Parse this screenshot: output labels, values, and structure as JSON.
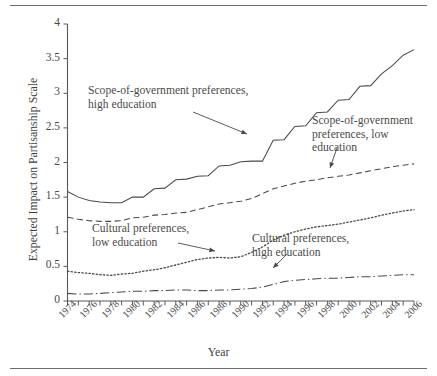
{
  "chart_data": {
    "type": "line",
    "title": "",
    "xlabel": "Year",
    "ylabel": "Expected Impact on Partisanship Scale",
    "xlim": [
      1974,
      2006
    ],
    "ylim": [
      0,
      4
    ],
    "yticks": [
      "0",
      "0.5",
      "1",
      "1.5",
      "2",
      "2.5",
      "3",
      "3.5",
      "4"
    ],
    "ytick_values": [
      0,
      0.5,
      1,
      1.5,
      2,
      2.5,
      3,
      3.5,
      4
    ],
    "xticks": [
      "1974",
      "1976",
      "1978",
      "1980",
      "1982",
      "1984",
      "1986",
      "1988",
      "1990",
      "1992",
      "1994",
      "1996",
      "1998",
      "2000",
      "2002",
      "2004",
      "2006"
    ],
    "xtick_values": [
      1974,
      1976,
      1978,
      1980,
      1982,
      1984,
      1986,
      1988,
      1990,
      1992,
      1994,
      1996,
      1998,
      2000,
      2002,
      2004,
      2006
    ],
    "minor_ticks_every": 1,
    "grid": false,
    "legend_position": "inline-annotations",
    "x": [
      1974,
      1975,
      1976,
      1977,
      1978,
      1979,
      1980,
      1981,
      1982,
      1983,
      1984,
      1985,
      1986,
      1987,
      1988,
      1989,
      1990,
      1991,
      1992,
      1993,
      1994,
      1995,
      1996,
      1997,
      1998,
      1999,
      2000,
      2001,
      2002,
      2003,
      2004,
      2005,
      2006
    ],
    "series": [
      {
        "name": "Scope-of-government preferences, high education",
        "style": "solid",
        "values": [
          1.58,
          1.5,
          1.45,
          1.43,
          1.42,
          1.42,
          1.5,
          1.5,
          1.62,
          1.63,
          1.75,
          1.76,
          1.8,
          1.81,
          1.95,
          1.96,
          2.01,
          2.02,
          2.02,
          2.32,
          2.33,
          2.52,
          2.53,
          2.72,
          2.73,
          2.9,
          2.91,
          3.1,
          3.11,
          3.28,
          3.4,
          3.55,
          3.63
        ]
      },
      {
        "name": "Scope-of-government preferences, low education",
        "style": "dashed",
        "values": [
          1.21,
          1.18,
          1.16,
          1.15,
          1.15,
          1.16,
          1.2,
          1.21,
          1.24,
          1.25,
          1.27,
          1.28,
          1.32,
          1.36,
          1.4,
          1.42,
          1.44,
          1.48,
          1.55,
          1.62,
          1.66,
          1.7,
          1.73,
          1.75,
          1.78,
          1.8,
          1.82,
          1.85,
          1.88,
          1.91,
          1.94,
          1.96,
          1.98
        ]
      },
      {
        "name": "Cultural preferences, low education",
        "style": "dotted",
        "values": [
          0.43,
          0.41,
          0.4,
          0.38,
          0.37,
          0.39,
          0.4,
          0.43,
          0.45,
          0.48,
          0.52,
          0.56,
          0.6,
          0.62,
          0.63,
          0.62,
          0.64,
          0.7,
          0.78,
          0.88,
          0.95,
          1.0,
          1.04,
          1.07,
          1.09,
          1.11,
          1.14,
          1.17,
          1.2,
          1.24,
          1.27,
          1.3,
          1.32
        ]
      },
      {
        "name": "Cultural preferences, high education",
        "style": "dashdot",
        "values": [
          0.11,
          0.1,
          0.1,
          0.11,
          0.12,
          0.13,
          0.14,
          0.14,
          0.15,
          0.15,
          0.16,
          0.16,
          0.15,
          0.15,
          0.16,
          0.16,
          0.17,
          0.18,
          0.2,
          0.24,
          0.28,
          0.3,
          0.31,
          0.32,
          0.33,
          0.33,
          0.34,
          0.35,
          0.35,
          0.36,
          0.37,
          0.38,
          0.38
        ]
      }
    ],
    "annotations": [
      {
        "id": "sg-high",
        "text": "Scope-of-government preferences,\nhigh education",
        "target_series": "Scope-of-government preferences, high education"
      },
      {
        "id": "sg-low",
        "text": "Scope-of-government\npreferences, low\neducation",
        "target_series": "Scope-of-government preferences, low education"
      },
      {
        "id": "cult-low",
        "text": "Cultural preferences,\nlow education",
        "target_series": "Cultural preferences, low education"
      },
      {
        "id": "cult-high",
        "text": "Cultural preferences,\nhigh education",
        "target_series": "Cultural preferences, high education"
      }
    ],
    "colors": {
      "line": "#4a4a4a",
      "axis": "#5a5a5a",
      "text": "#3f3f3f",
      "rule": "#6e6e6e",
      "background": "#ffffff"
    }
  }
}
